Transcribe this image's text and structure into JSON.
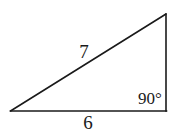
{
  "figure": {
    "type": "right-triangle",
    "background": "#ffffff",
    "stroke_color": "#1a1a1a",
    "vertices": {
      "left": [
        10.5,
        111
      ],
      "bottom_right": [
        166,
        111
      ],
      "top_right": [
        166,
        14
      ]
    },
    "labels": {
      "hypotenuse": "7",
      "base": "6",
      "right_angle": "90°"
    }
  }
}
